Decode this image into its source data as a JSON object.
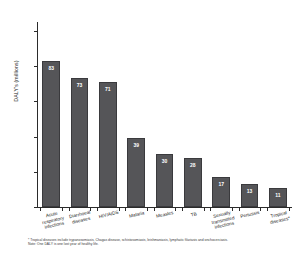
{
  "chart_data": {
    "type": "bar",
    "title": "",
    "xlabel": "",
    "ylabel": "DALY's (millions)",
    "ylim": [
      0,
      105
    ],
    "yticks": [
      0,
      20,
      40,
      60,
      80,
      100
    ],
    "ytick_labels": [
      "0",
      "20",
      "40",
      "60",
      "80",
      "100"
    ],
    "grid": false,
    "legend": "none",
    "categories": [
      "Acute\nrespiratory\ninfections",
      "Diarrhoeal\ndiseases",
      "HIV/AIDS",
      "Malaria",
      "Measles",
      "TB",
      "Sexually\ntransmitted\ninfections",
      "Pertussis",
      "Tropical\ndiseases*"
    ],
    "values": [
      83,
      73,
      71,
      39,
      30,
      28,
      17,
      13,
      11
    ],
    "value_labels": [
      "83",
      "73",
      "71",
      "39",
      "30",
      "28",
      "17",
      "13",
      "11"
    ],
    "bar_color": "#555558",
    "bar_edge_color": "#3a3a3d",
    "value_label_color": "#ffffff",
    "axis_color": "#2b2b2b"
  },
  "footnote": {
    "line1": "* Tropical diseases include trypanosomiasis, Chagas disease, schistosomiasis, leishmaniasis, lymphatic filariasis and onchocerciasis.",
    "line2": "Note: One DALY is one lost year of healthy life."
  }
}
